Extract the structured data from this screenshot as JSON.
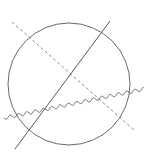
{
  "diagram": {
    "title": "",
    "elements": [
      {
        "id": "circle",
        "kind": "circle",
        "style": "solid"
      },
      {
        "id": "straight-line",
        "kind": "line",
        "style": "solid"
      },
      {
        "id": "dashed-line",
        "kind": "line",
        "style": "dashed"
      },
      {
        "id": "wavy-line",
        "kind": "wavy-line",
        "style": "solid"
      }
    ],
    "colors": {
      "stroke": "#5a5a5a",
      "dashed_stroke": "#8a8a8a",
      "background": "#ffffff"
    }
  }
}
